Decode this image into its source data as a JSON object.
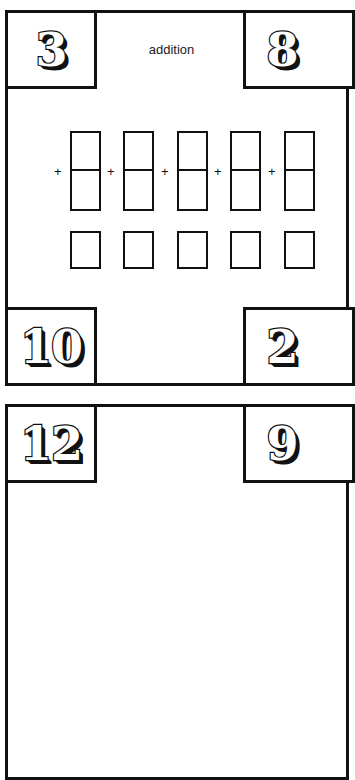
{
  "page": {
    "background_color": "#ffffff",
    "ink_color": "#111111"
  },
  "worksheet": {
    "title": "addition",
    "corners": {
      "top_left": "3",
      "top_right": "8",
      "bottom_left": "10",
      "bottom_right": "2"
    },
    "plus_sign": "+",
    "problem_columns": [
      {
        "left": 62,
        "plus": "+"
      },
      {
        "left": 115,
        "plus": "+"
      },
      {
        "left": 169,
        "plus": "+"
      },
      {
        "left": 222,
        "plus": "+"
      },
      {
        "left": 276,
        "plus": "+"
      }
    ]
  },
  "next_worksheet": {
    "corners": {
      "top_left": "12",
      "top_right": "9"
    }
  }
}
